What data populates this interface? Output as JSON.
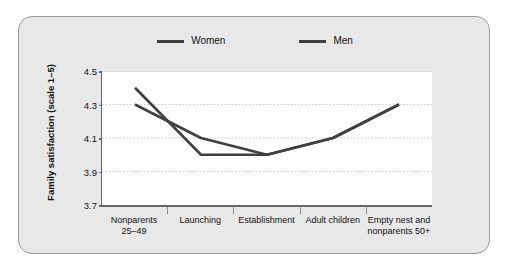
{
  "figure": {
    "background_color": "#e8e8e8",
    "border_color": "#9a9a9a",
    "plot_background_color": "#ffffff",
    "series_color": "#404040"
  },
  "chart_data": {
    "type": "line",
    "title": "",
    "xlabel": "",
    "ylabel": "Family satisfaction (scale 1–5)",
    "categories": [
      "Nonparents\n25–49",
      "Launching",
      "Establishment",
      "Adult children",
      "Empty nest and\nnonparents 50+"
    ],
    "category_lines": [
      [
        "Nonparents",
        "25–49"
      ],
      [
        "Launching",
        ""
      ],
      [
        "Establishment",
        ""
      ],
      [
        "Adult children",
        ""
      ],
      [
        "Empty nest and",
        "nonparents 50+"
      ]
    ],
    "series": [
      {
        "name": "Women",
        "values": [
          4.4,
          4.0,
          4.0,
          4.1,
          4.3
        ],
        "color": "#404040"
      },
      {
        "name": "Men",
        "values": [
          4.3,
          4.1,
          4.0,
          4.1,
          4.3
        ],
        "color": "#404040"
      }
    ],
    "ylim": [
      3.7,
      4.5
    ],
    "yticks": [
      4.5,
      4.3,
      4.1,
      3.9,
      3.7
    ],
    "ytick_labels": [
      "4.5",
      "4.3",
      "4.1",
      "3.9",
      "3.7"
    ],
    "grid": true,
    "grid_style": "dotted",
    "legend_position": "top-center",
    "legend": [
      "Women",
      "Men"
    ]
  }
}
